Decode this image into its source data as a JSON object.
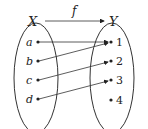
{
  "function_label": "f",
  "domain": {
    "label": "X",
    "elements": [
      "a",
      "b",
      "c",
      "d"
    ]
  },
  "codomain": {
    "label": "Y",
    "elements": [
      "1",
      "2",
      "3",
      "4"
    ]
  },
  "mapping": [
    {
      "from": "a",
      "to": "1"
    },
    {
      "from": "b",
      "to": "1"
    },
    {
      "from": "c",
      "to": "2"
    },
    {
      "from": "d",
      "to": "3"
    }
  ],
  "colors": {
    "stroke": "#222222",
    "background": "#ffffff"
  }
}
